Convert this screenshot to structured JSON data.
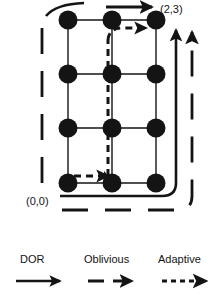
{
  "figure": {
    "title_labels": {
      "top_right_node": "(2,3)",
      "origin_node": "(0,0)"
    },
    "colors": {
      "ink": "#141414",
      "background": "#ffffff",
      "node_fill": "#141414",
      "grid_line": "#141414"
    },
    "grid": {
      "columns": 3,
      "rows": 4,
      "node_radius": 9,
      "x_positions": [
        68,
        112,
        156
      ],
      "y_positions": [
        20,
        74,
        128,
        183
      ],
      "node_count": 12
    },
    "routes": [
      {
        "name": "DOR",
        "style": "solid",
        "description": "solid route exits right of bottom row, wraps around bottom-right corner and travels up the right side with an upward arrowhead at the top"
      },
      {
        "name": "Oblivious",
        "style": "long-dash",
        "description": "long-dashed route along left column and bottom, wrapping at bottom-right and rising on the far right with an upward arrowhead"
      },
      {
        "name": "Adaptive",
        "style": "fine-dash",
        "description": "fine-dashed route from the origin node right then up the middle column, turning right at the top with an arrowhead into node (2,3)"
      }
    ]
  },
  "legend": {
    "position": "bottom",
    "items": [
      {
        "label": "DOR",
        "style": "solid",
        "icon": "solid-arrow-icon"
      },
      {
        "label": "Oblivious",
        "style": "long-dash",
        "icon": "dashed-arrow-icon"
      },
      {
        "label": "Adaptive",
        "style": "fine-dash",
        "icon": "dotted-arrow-icon"
      }
    ]
  }
}
